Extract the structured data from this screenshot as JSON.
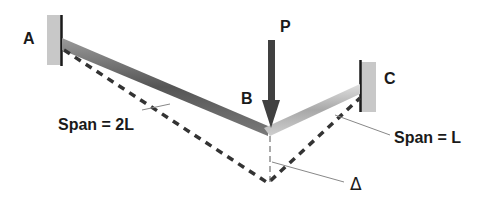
{
  "diagram": {
    "labels": {
      "support_a": "A",
      "support_c": "C",
      "joint_b": "B",
      "load": "P",
      "span_left": "Span = 2L",
      "span_right": "Span = L",
      "deflection": "Δ"
    },
    "colors": {
      "wall_fill": "#c8c8c8",
      "wall_edge": "#1a1a1a",
      "beam_left": "#5a5a5a",
      "beam_right": "#b8b8b8",
      "arrow": "#404040",
      "dashed": "#333333",
      "leader": "#888888"
    }
  }
}
